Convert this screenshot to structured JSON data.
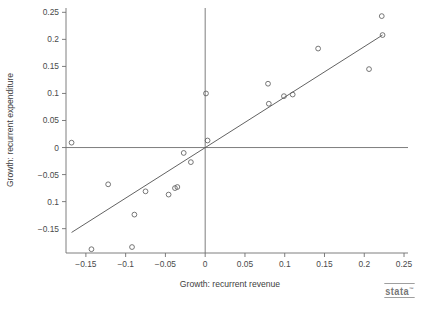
{
  "chart_data": {
    "type": "scatter",
    "title": "",
    "subtitle": "",
    "xlabel": "Growth: recurrent revenue",
    "ylabel": "Growth: recurrent expenditure",
    "xlim": [
      -0.175,
      0.255
    ],
    "ylim": [
      -0.195,
      0.258
    ],
    "xticks": [
      -0.15,
      -0.1,
      -0.05,
      0,
      0.05,
      0.1,
      0.15,
      0.2,
      0.25
    ],
    "xticklabels": [
      "-0.15",
      "-0.1",
      "-0.05",
      "0",
      "0.05",
      "0.1",
      "0.15",
      "0.2",
      "0.25"
    ],
    "yticks": [
      0.25,
      0.2,
      0.15,
      0.1,
      0.05,
      0,
      -0.05,
      -0.1,
      -0.15
    ],
    "yticklabels": [
      "0.25",
      "0.2",
      "0.15",
      "0.1",
      "0.05",
      "0",
      "-0.05",
      "0.1",
      "-0.15"
    ],
    "grid": false,
    "legend": null,
    "reference_lines": [
      {
        "name": "horizontal-zero-line",
        "orientation": "horizontal",
        "value": 0
      },
      {
        "name": "vertical-zero-line",
        "orientation": "vertical",
        "value": 0
      }
    ],
    "fit_line": {
      "name": "linear-fit",
      "x": [
        -0.168,
        0.223
      ],
      "y": [
        -0.157,
        0.208
      ]
    },
    "marker": {
      "shape": "open-circle",
      "radius_px": 2.4
    },
    "points": [
      {
        "x": -0.168,
        "y": 0.009
      },
      {
        "x": -0.143,
        "y": -0.188
      },
      {
        "x": -0.122,
        "y": -0.068
      },
      {
        "x": -0.092,
        "y": -0.184
      },
      {
        "x": -0.089,
        "y": -0.124
      },
      {
        "x": -0.075,
        "y": -0.081
      },
      {
        "x": -0.046,
        "y": -0.087
      },
      {
        "x": -0.038,
        "y": -0.075
      },
      {
        "x": -0.035,
        "y": -0.073
      },
      {
        "x": -0.027,
        "y": -0.01
      },
      {
        "x": -0.018,
        "y": -0.027
      },
      {
        "x": 0.001,
        "y": 0.1
      },
      {
        "x": 0.003,
        "y": 0.013
      },
      {
        "x": 0.079,
        "y": 0.118
      },
      {
        "x": 0.08,
        "y": 0.081
      },
      {
        "x": 0.099,
        "y": 0.095
      },
      {
        "x": 0.11,
        "y": 0.098
      },
      {
        "x": 0.142,
        "y": 0.183
      },
      {
        "x": 0.206,
        "y": 0.145
      },
      {
        "x": 0.222,
        "y": 0.243
      },
      {
        "x": 0.223,
        "y": 0.208
      }
    ]
  },
  "branding": {
    "logo_text": "stata",
    "trademark": "™"
  }
}
